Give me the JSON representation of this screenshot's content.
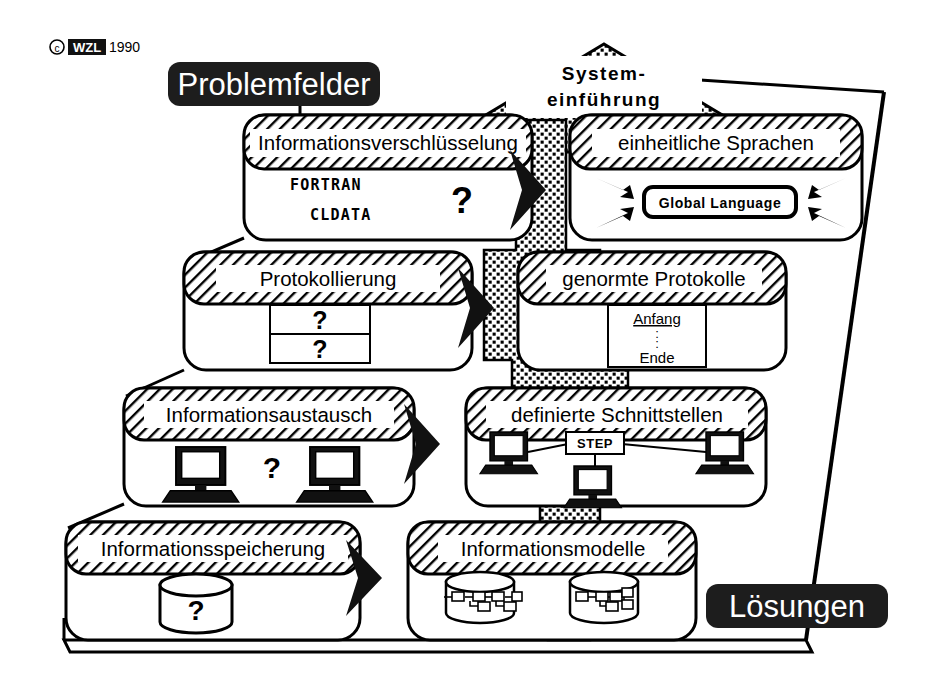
{
  "diagram": {
    "copyright": "©",
    "org_logo": "WZL",
    "year": "1990",
    "left_banner": "Problemfelder",
    "right_banner": "Lösungen",
    "peak_label_line1": "System-",
    "peak_label_line2": "einführung",
    "colors": {
      "ink": "#000000",
      "banner_fill": "#1d1d1d",
      "banner_text": "#ffffff",
      "hatch": "#000000",
      "panel_fill": "#ffffff",
      "stipple": "#000000"
    }
  },
  "rows": [
    {
      "problem": {
        "title": "Informationsverschlüsselung",
        "items": [
          "FORTRAN",
          "CLDATA"
        ],
        "unknown": "?"
      },
      "solution": {
        "title": "einheitliche Sprachen",
        "chip": "Global Language",
        "arrow_count": 4
      }
    },
    {
      "problem": {
        "title": "Protokollierung",
        "cells": [
          "?",
          "?"
        ]
      },
      "solution": {
        "title": "genormte Protokolle",
        "lines": [
          "Anfang",
          ":",
          ":",
          "Ende"
        ]
      }
    },
    {
      "problem": {
        "title": "Informationsaustausch",
        "unknown": "?",
        "computers": 2
      },
      "solution": {
        "title": "definierte Schnittstellen",
        "chip": "STEP",
        "computers": 3
      }
    },
    {
      "problem": {
        "title": "Informationsspeicherung",
        "unknown": "?",
        "cylinders": 1
      },
      "solution": {
        "title": "Informationsmodelle",
        "cylinders": 2
      }
    }
  ]
}
